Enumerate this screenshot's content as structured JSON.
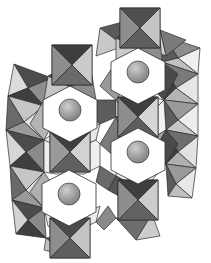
{
  "figure": {
    "background_color": "#ffffff",
    "width": 211,
    "height": 263
  },
  "palette": {
    "face_dark": "#3f3f3f",
    "face_mid_dark": "#6f6f6f",
    "face_mid": "#909090",
    "face_light": "#c2c2c2",
    "face_very_light": "#e2e2e2",
    "face_white": "#fbfbfb",
    "edge": "#2b2b2b",
    "void_fill": "#ffffff",
    "sphere_fill": "#9a9a9a",
    "sphere_highlight": "#c9c9c9",
    "sphere_edge": "#4a4a4a"
  },
  "structure": {
    "cavity_label": "hexagonal-tunnel",
    "octahedron_label": "octahedron",
    "sphere_label": "cation-site",
    "cavities": [
      {
        "name": "cavity-upper-left",
        "cx": 70,
        "cy": 110,
        "r": 46,
        "rotation": 0
      },
      {
        "name": "cavity-upper-right",
        "cx": 138,
        "cy": 72,
        "r": 46,
        "rotation": 0
      },
      {
        "name": "cavity-lower-left",
        "cx": 69,
        "cy": 194,
        "r": 46,
        "rotation": 0
      },
      {
        "name": "cavity-lower-right",
        "cx": 138,
        "cy": 152,
        "r": 46,
        "rotation": 0
      }
    ],
    "spheres": [
      {
        "name": "cation-upper-left",
        "cx": 70,
        "cy": 110,
        "r": 11
      },
      {
        "name": "cation-upper-right",
        "cx": 138,
        "cy": 72,
        "r": 11
      },
      {
        "name": "cation-lower-left",
        "cx": 69,
        "cy": 194,
        "r": 11
      },
      {
        "name": "cation-lower-right",
        "cx": 138,
        "cy": 152,
        "r": 11
      }
    ],
    "square_octahedra": [
      {
        "name": "oct-top-cap",
        "cx": 140,
        "cy": 27,
        "half": 20,
        "faces": [
          "#4a4a4a",
          "#8d8d8d",
          "#c4c4c4",
          "#6e6e6e"
        ]
      },
      {
        "name": "oct-upper-mid",
        "cx": 72,
        "cy": 65,
        "half": 20,
        "faces": [
          "#4a4a4a",
          "#8d8d8d",
          "#c4c4c4",
          "#6e6e6e"
        ]
      },
      {
        "name": "oct-center-upper",
        "cx": 138,
        "cy": 117,
        "half": 20,
        "faces": [
          "#3f3f3f",
          "#8d8d8d",
          "#d2d2d2",
          "#6a6a6a"
        ]
      },
      {
        "name": "oct-center-left",
        "cx": 70,
        "cy": 152,
        "half": 20,
        "faces": [
          "#3f3f3f",
          "#9a9a9a",
          "#cfcfcf",
          "#676767"
        ]
      },
      {
        "name": "oct-lower-mid",
        "cx": 138,
        "cy": 200,
        "half": 20,
        "faces": [
          "#3f3f3f",
          "#8d8d8d",
          "#c8c8c8",
          "#6a6a6a"
        ]
      },
      {
        "name": "oct-bottom-cap",
        "cx": 70,
        "cy": 238,
        "half": 20,
        "faces": [
          "#4a4a4a",
          "#8d8d8d",
          "#c4c4c4",
          "#6e6e6e"
        ]
      }
    ],
    "edge_octahedra": [
      {
        "name": "oct-edge-left-a",
        "cx": 26,
        "cy": 87,
        "rx": 26,
        "ry": 22,
        "faces": [
          "#5a5a5a",
          "#d8d8d8",
          "#8f8f8f",
          "#3f3f3f"
        ]
      },
      {
        "name": "oct-edge-left-b",
        "cx": 26,
        "cy": 133,
        "rx": 26,
        "ry": 22,
        "faces": [
          "#5a5a5a",
          "#dcdcdc",
          "#8f8f8f",
          "#3f3f3f"
        ]
      },
      {
        "name": "oct-edge-left-c",
        "cx": 26,
        "cy": 171,
        "rx": 26,
        "ry": 22,
        "faces": [
          "#5a5a5a",
          "#d8d8d8",
          "#8f8f8f",
          "#3f3f3f"
        ]
      },
      {
        "name": "oct-edge-left-d",
        "cx": 26,
        "cy": 216,
        "rx": 26,
        "ry": 22,
        "faces": [
          "#5a5a5a",
          "#dcdcdc",
          "#8f8f8f",
          "#3f3f3f"
        ]
      },
      {
        "name": "oct-edge-right-a",
        "cx": 184,
        "cy": 49,
        "rx": 26,
        "ry": 22,
        "faces": [
          "#8d8d8d",
          "#e0e0e0",
          "#b4b4b4",
          "#5c5c5c"
        ]
      },
      {
        "name": "oct-edge-right-b",
        "cx": 184,
        "cy": 92,
        "rx": 26,
        "ry": 22,
        "faces": [
          "#8d8d8d",
          "#e4e4e4",
          "#b4b4b4",
          "#5c5c5c"
        ]
      },
      {
        "name": "oct-edge-right-c",
        "cx": 184,
        "cy": 130,
        "rx": 26,
        "ry": 22,
        "faces": [
          "#8d8d8d",
          "#e0e0e0",
          "#b4b4b4",
          "#5c5c5c"
        ]
      },
      {
        "name": "oct-edge-right-d",
        "cx": 184,
        "cy": 173,
        "rx": 26,
        "ry": 22,
        "faces": [
          "#8d8d8d",
          "#e4e4e4",
          "#b4b4b4",
          "#5c5c5c"
        ]
      }
    ],
    "ring_octahedra_count_per_cavity": 6,
    "ring_face_shades": [
      "#3f3f3f",
      "#5e5e5e",
      "#8d8d8d",
      "#b0b0b0",
      "#d2d2d2",
      "#efefef"
    ]
  }
}
